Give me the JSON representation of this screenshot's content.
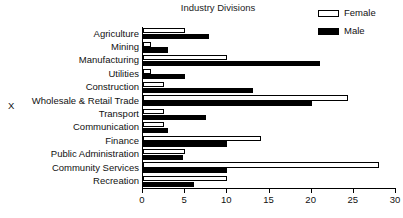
{
  "chart_data": {
    "type": "bar",
    "orientation": "horizontal",
    "title": "Industry Divisions",
    "xlabel": "",
    "ylabel": "X",
    "xlim": [
      0,
      30
    ],
    "xticks": [
      0,
      5,
      10,
      15,
      20,
      25,
      30
    ],
    "grid": false,
    "legend_position": "top-right",
    "categories": [
      "Agriculture",
      "Mining",
      "Manufacturing",
      "Utilities",
      "Construction",
      "Wholesale & Retail Trade",
      "Transport",
      "Communication",
      "Finance",
      "Public Administration",
      "Community Services",
      "Recreation"
    ],
    "series": [
      {
        "name": "Female",
        "color": "#ffffff",
        "edge_color": "#000000",
        "values": [
          5,
          1,
          10,
          1,
          2.5,
          24.3,
          2.5,
          2.5,
          14,
          5,
          28,
          10
        ]
      },
      {
        "name": "Male",
        "color": "#000000",
        "edge_color": "#000000",
        "values": [
          7.8,
          3,
          21,
          5,
          13,
          20,
          7.5,
          3,
          10,
          4.8,
          10,
          6
        ]
      }
    ]
  },
  "legend": {
    "items": [
      {
        "label": "Female",
        "swatch": "female-swatch-icon"
      },
      {
        "label": "Male",
        "swatch": "male-swatch-icon"
      }
    ]
  },
  "axis": {
    "y_label": "X",
    "x_tick_labels": [
      "0",
      "5",
      "10",
      "15",
      "20",
      "25",
      "30"
    ]
  }
}
